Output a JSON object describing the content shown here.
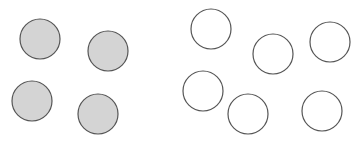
{
  "diagram": {
    "width": 360,
    "height": 141,
    "background": "#ffffff",
    "groups": [
      {
        "name": "filled-group",
        "fill": "#d4d4d4",
        "stroke": "#555555",
        "count": 4,
        "circles": [
          {
            "cx": 40,
            "cy": 39,
            "r": 20
          },
          {
            "cx": 108,
            "cy": 51,
            "r": 20
          },
          {
            "cx": 32,
            "cy": 101,
            "r": 20
          },
          {
            "cx": 98,
            "cy": 114,
            "r": 20
          }
        ]
      },
      {
        "name": "empty-group",
        "fill": "#ffffff",
        "stroke": "#555555",
        "count": 6,
        "circles": [
          {
            "cx": 211,
            "cy": 29,
            "r": 20
          },
          {
            "cx": 273,
            "cy": 54,
            "r": 20
          },
          {
            "cx": 330,
            "cy": 42,
            "r": 20
          },
          {
            "cx": 203,
            "cy": 91,
            "r": 20
          },
          {
            "cx": 248,
            "cy": 114,
            "r": 20
          },
          {
            "cx": 322,
            "cy": 111,
            "r": 20
          }
        ]
      }
    ]
  }
}
